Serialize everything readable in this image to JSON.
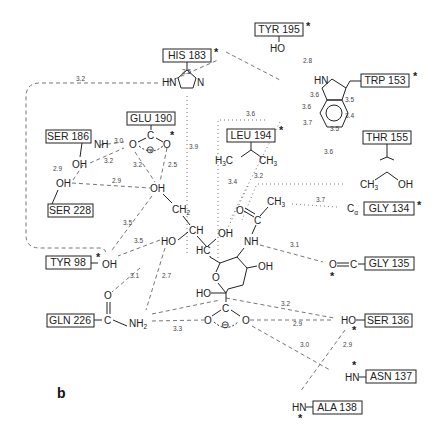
{
  "figure": {
    "panel_label": "b",
    "residues": [
      {
        "id": "his183",
        "label": "HIS 183",
        "starred": true
      },
      {
        "id": "tyr195",
        "label": "TYR 195",
        "starred": true
      },
      {
        "id": "trp153",
        "label": "TRP 153",
        "starred": true
      },
      {
        "id": "glu190",
        "label": "GLU 190",
        "starred": true
      },
      {
        "id": "leu194",
        "label": "LEU 194",
        "starred": true
      },
      {
        "id": "thr155",
        "label": "THR 155",
        "starred": false
      },
      {
        "id": "ser186",
        "label": "SER 186",
        "starred": false
      },
      {
        "id": "ser228",
        "label": "SER 228",
        "starred": false
      },
      {
        "id": "gly134",
        "label": "GLY 134",
        "starred": true
      },
      {
        "id": "gly135",
        "label": "GLY 135",
        "starred": true
      },
      {
        "id": "tyr98",
        "label": "TYR 98",
        "starred": true
      },
      {
        "id": "gln226",
        "label": "GLN 226",
        "starred": false
      },
      {
        "id": "ser136",
        "label": "SER 136",
        "starred": true
      },
      {
        "id": "asn137",
        "label": "ASN 137",
        "starred": true
      },
      {
        "id": "ala138",
        "label": "ALA 138",
        "starred": true
      }
    ],
    "atoms": {
      "tyr195_oh": "HO",
      "his_hn": "HN",
      "his_n": "N",
      "trp_hn": "HN",
      "ser186_nh": "NH",
      "ser186_oh": "OH",
      "ser228_oh": "OH",
      "glu_o1": "O",
      "glu_c": "C",
      "glu_o2": "O",
      "leu_h3c": "H3C",
      "leu_ch3": "CH3",
      "thr_ch3": "CH3",
      "thr_oh": "OH",
      "gly134_ca": "Cα",
      "gly135_o": "O",
      "gly135_c": "C",
      "tyr98_oh": "OH",
      "gln_o": "O",
      "gln_c": "C",
      "gln_nh2": "NH2",
      "ser136_ho": "HO",
      "asn137_hn": "HN",
      "ala138_hn": "HN",
      "lig_oh9": "OH",
      "lig_ch2": "CH2",
      "lig_ch": "CH",
      "lig_ho8": "HO",
      "lig_hc": "HC",
      "lig_oh7": "OH",
      "lig_o_ac": "O",
      "lig_c_ac": "C",
      "lig_ch3_ac": "CH3",
      "lig_nh": "NH",
      "lig_oh4": "OH",
      "lig_ring_o": "O",
      "lig_ho2": "HO",
      "lig_carb_c": "C",
      "lig_carb_o1": "O",
      "lig_carb_o2": "O",
      "minus": "⊖"
    },
    "distances": {
      "his_loop": "3.2",
      "his_tyr195": "2.5",
      "tyr195_trp": "2.8",
      "trp_a": "3.6",
      "trp_b": "3.6",
      "trp_c": "3.5",
      "trp_d": "3.4",
      "trp_e": "3.7",
      "trp_f": "3.5",
      "leu_top": "3.6",
      "his_glu": "3.9",
      "ser186_glu": "3.0",
      "ser186oh_glu": "3.2",
      "ser_ser": "2.9",
      "ser228_oh9": "2.9",
      "glu_oh9_a": "3.2",
      "glu_oh9_b": "2.5",
      "leu_a": "3.4",
      "leu_b": "3.2",
      "thr_leu": "3.6",
      "ch3_gly134": "3.7",
      "nh_gly135": "3.1",
      "tyr98_oh9": "3.5",
      "tyr98_oh8": "3.5",
      "gln_o_tyr98": "3.1",
      "gln_nh2_oh8": "2.7",
      "gln_carb": "3.3",
      "carb_ser136_a": "3.2",
      "carb_ser136_b": "2.9",
      "carb_asn": "3.0",
      "ser136_ala": "2.9"
    },
    "asterisk": "*"
  }
}
